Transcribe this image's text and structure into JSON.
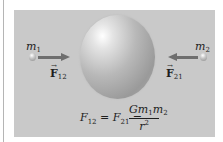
{
  "diagram": {
    "masses": [
      {
        "label": "m",
        "subscript": "1",
        "position": "left"
      },
      {
        "label": "m",
        "subscript": "2",
        "position": "right"
      }
    ],
    "forces": [
      {
        "label": "F",
        "subscript": "12",
        "direction": "right",
        "vector": true
      },
      {
        "label": "F",
        "subscript": "21",
        "direction": "left",
        "vector": true
      }
    ],
    "central_object": "sphere",
    "formula": {
      "lhs_1": "F",
      "lhs_1_sub": "12",
      "eq1": " = ",
      "lhs_2": "F",
      "lhs_2_sub": "21",
      "eq2": " = ",
      "numerator_G": "Gm",
      "numerator_sub1": "1",
      "numerator_m": "m",
      "numerator_sub2": "2",
      "denominator": "r",
      "denominator_sup": "2"
    },
    "vector_arrow_glyph": "→",
    "colors": {
      "panel": "#c9c9c9",
      "arrow": "#6e6e6e",
      "text": "#1e1e1e"
    }
  }
}
